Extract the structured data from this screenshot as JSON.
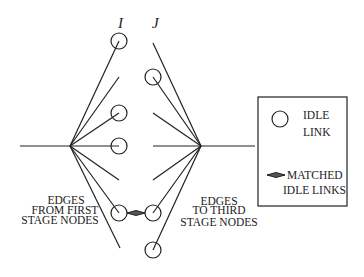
{
  "columns": {
    "left_label": "I",
    "right_label": "J"
  },
  "captions": {
    "left": [
      "EDGES",
      "FROM FIRST",
      "STAGE NODES"
    ],
    "right": [
      "EDGES",
      "TO THIRD",
      "STAGE NODES"
    ]
  },
  "legend": {
    "idle_link_line1": "IDLE",
    "idle_link_line2": "LINK",
    "matched_line1": "MATCHED",
    "matched_line2": "IDLE LINKS"
  },
  "colors": {
    "stroke": "#222222",
    "background": "#ffffff"
  },
  "geometry": {
    "left_hub": [
      70,
      146
    ],
    "right_hub": [
      201,
      146
    ],
    "left_circles_y": [
      41,
      113,
      146,
      213
    ],
    "right_circles_y": [
      77,
      213,
      250
    ]
  }
}
